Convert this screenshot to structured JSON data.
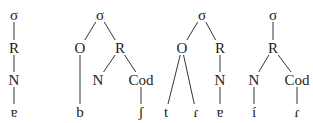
{
  "diagram": {
    "type": "syllable-structure-trees",
    "colors": {
      "line": "#333333",
      "text": "#222222",
      "background": "#ffffff"
    },
    "trees": [
      {
        "id": "tree1",
        "nodes": [
          {
            "id": "s",
            "label": "σ",
            "x": 14,
            "y": 15
          },
          {
            "id": "r",
            "label": "R",
            "x": 14,
            "y": 48
          },
          {
            "id": "n",
            "label": "N",
            "x": 14,
            "y": 80
          },
          {
            "id": "v",
            "label": "ɐ",
            "x": 14,
            "y": 112
          }
        ],
        "edges": [
          [
            "s",
            "r"
          ],
          [
            "r",
            "n"
          ],
          [
            "n",
            "v"
          ]
        ]
      },
      {
        "id": "tree2",
        "nodes": [
          {
            "id": "s",
            "label": "σ",
            "x": 100,
            "y": 15
          },
          {
            "id": "o",
            "label": "O",
            "x": 80,
            "y": 48
          },
          {
            "id": "r",
            "label": "R",
            "x": 120,
            "y": 48
          },
          {
            "id": "n",
            "label": "N",
            "x": 98,
            "y": 80
          },
          {
            "id": "c",
            "label": "Cod",
            "x": 141,
            "y": 80
          },
          {
            "id": "b",
            "label": "b",
            "x": 80,
            "y": 112
          },
          {
            "id": "sh",
            "label": "ʃ",
            "x": 141,
            "y": 112
          }
        ],
        "edges": [
          [
            "s",
            "o"
          ],
          [
            "s",
            "r"
          ],
          [
            "r",
            "n"
          ],
          [
            "r",
            "c"
          ],
          [
            "o",
            "b"
          ],
          [
            "c",
            "sh"
          ]
        ]
      },
      {
        "id": "tree3",
        "nodes": [
          {
            "id": "s",
            "label": "σ",
            "x": 202,
            "y": 15
          },
          {
            "id": "o",
            "label": "O",
            "x": 182,
            "y": 48
          },
          {
            "id": "r",
            "label": "R",
            "x": 220,
            "y": 48
          },
          {
            "id": "n",
            "label": "N",
            "x": 220,
            "y": 80
          },
          {
            "id": "t",
            "label": "t",
            "x": 166,
            "y": 112
          },
          {
            "id": "tap",
            "label": "ɾ",
            "x": 196,
            "y": 112
          },
          {
            "id": "v",
            "label": "ɐ",
            "x": 220,
            "y": 112
          }
        ],
        "edges": [
          [
            "s",
            "o"
          ],
          [
            "s",
            "r"
          ],
          [
            "r",
            "n"
          ],
          [
            "o",
            "t"
          ],
          [
            "o",
            "tap"
          ],
          [
            "n",
            "v"
          ]
        ]
      },
      {
        "id": "tree4",
        "nodes": [
          {
            "id": "s",
            "label": "σ",
            "x": 273,
            "y": 15
          },
          {
            "id": "r",
            "label": "R",
            "x": 273,
            "y": 48
          },
          {
            "id": "n",
            "label": "N",
            "x": 254,
            "y": 80
          },
          {
            "id": "c",
            "label": "Cod",
            "x": 297,
            "y": 80
          },
          {
            "id": "i",
            "label": "í",
            "x": 254,
            "y": 112
          },
          {
            "id": "tap",
            "label": "ɾ",
            "x": 297,
            "y": 112
          }
        ],
        "edges": [
          [
            "s",
            "r"
          ],
          [
            "r",
            "n"
          ],
          [
            "r",
            "c"
          ],
          [
            "n",
            "i"
          ],
          [
            "c",
            "tap"
          ]
        ]
      }
    ]
  }
}
